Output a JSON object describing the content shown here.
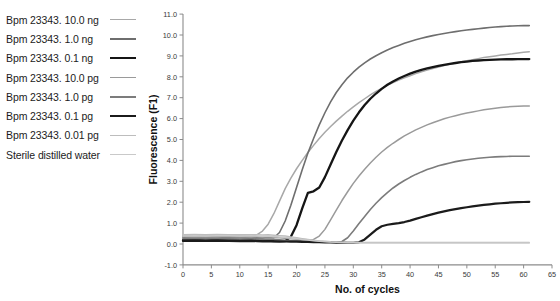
{
  "legend": {
    "position": "left",
    "items": [
      {
        "label": "Bpm 23343. 10.0 ng",
        "color": "#a8a8a8",
        "width": 1.5
      },
      {
        "label": "Bpm 23343. 1.0 ng",
        "color": "#6e6e6e",
        "width": 1.6
      },
      {
        "label": "Bpm 23343. 0.1 ng",
        "color": "#151515",
        "width": 2.3
      },
      {
        "label": "Bpm 23343. 10.0 pg",
        "color": "#9a9a9a",
        "width": 1.5
      },
      {
        "label": "Bpm 23343. 1.0 pg",
        "color": "#7c7c7c",
        "width": 1.6
      },
      {
        "label": "Bpm 23343. 0.1 pg",
        "color": "#1b1b1b",
        "width": 2.2
      },
      {
        "label": "Bpm 23343. 0.01 pg",
        "color": "#bdbdbd",
        "width": 1.4
      },
      {
        "label": "Sterile distilled water",
        "color": "#c9c9c9",
        "width": 1.5
      }
    ]
  },
  "chart_data": {
    "type": "line",
    "title": "",
    "xlabel": "No. of cycles",
    "ylabel": "Fluorescence (F1)",
    "xlim": [
      0,
      65
    ],
    "ylim": [
      -1.0,
      11.0
    ],
    "xticks": [
      0,
      5,
      10,
      15,
      20,
      25,
      30,
      35,
      40,
      45,
      50,
      55,
      60,
      65
    ],
    "xtick_labels": [
      "0",
      "5",
      "10",
      "15",
      "20",
      "25",
      "30",
      "35",
      "40",
      "45",
      "50",
      "55",
      "60",
      "65"
    ],
    "yticks": [
      -1.0,
      0.0,
      1.0,
      2.0,
      3.0,
      4.0,
      5.0,
      6.0,
      7.0,
      8.0,
      9.0,
      10.0,
      11.0
    ],
    "ytick_labels": [
      "-1.0",
      "0.0",
      "1.0",
      "2.0",
      "3.0",
      "4.0",
      "5.0",
      "6.0",
      "7.0",
      "8.0",
      "9.0",
      "10.0",
      "11.0"
    ],
    "grid": false,
    "x": [
      0,
      2,
      4,
      6,
      8,
      10,
      12,
      13,
      14,
      15,
      16,
      17,
      18,
      19,
      20,
      21,
      22,
      23,
      24,
      25,
      26,
      27,
      28,
      29,
      30,
      31,
      32,
      33,
      34,
      35,
      36,
      37,
      38,
      39,
      40,
      41,
      42,
      43,
      44,
      45,
      46,
      47,
      48,
      49,
      50,
      51,
      52,
      53,
      54,
      55,
      56,
      57,
      58,
      59,
      60,
      61
    ],
    "series": [
      {
        "name": "Bpm 23343. 10.0 ng",
        "color": "#a8a8a8",
        "width": 1.5,
        "plateau": 9.2,
        "takeoff_cycle": 13,
        "values": [
          0.4,
          0.42,
          0.4,
          0.43,
          0.41,
          0.42,
          0.4,
          0.44,
          0.62,
          0.95,
          1.45,
          2.05,
          2.65,
          3.15,
          3.6,
          4.0,
          4.38,
          4.72,
          5.05,
          5.35,
          5.62,
          5.88,
          6.12,
          6.35,
          6.56,
          6.76,
          6.95,
          7.13,
          7.3,
          7.45,
          7.59,
          7.72,
          7.84,
          7.95,
          8.05,
          8.15,
          8.24,
          8.32,
          8.4,
          8.47,
          8.54,
          8.6,
          8.66,
          8.72,
          8.77,
          8.82,
          8.87,
          8.92,
          8.96,
          9.0,
          9.04,
          9.07,
          9.1,
          9.14,
          9.17,
          9.2
        ]
      },
      {
        "name": "Bpm 23343. 1.0 ng",
        "color": "#6e6e6e",
        "width": 1.6,
        "plateau": 10.45,
        "takeoff_cycle": 16,
        "values": [
          0.3,
          0.28,
          0.3,
          0.29,
          0.31,
          0.3,
          0.28,
          0.3,
          0.29,
          0.31,
          0.3,
          0.55,
          1.1,
          1.85,
          2.7,
          3.55,
          4.35,
          5.05,
          5.7,
          6.28,
          6.8,
          7.25,
          7.62,
          7.95,
          8.22,
          8.46,
          8.67,
          8.85,
          9.01,
          9.15,
          9.28,
          9.4,
          9.5,
          9.6,
          9.69,
          9.77,
          9.84,
          9.91,
          9.97,
          10.02,
          10.07,
          10.12,
          10.16,
          10.2,
          10.24,
          10.27,
          10.3,
          10.33,
          10.36,
          10.38,
          10.4,
          10.42,
          10.43,
          10.44,
          10.45,
          10.45
        ]
      },
      {
        "name": "Bpm 23343. 0.1 ng",
        "color": "#151515",
        "width": 2.3,
        "plateau": 8.85,
        "takeoff_cycle": 18,
        "values": [
          0.18,
          0.2,
          0.18,
          0.19,
          0.17,
          0.19,
          0.18,
          0.17,
          0.18,
          0.16,
          0.14,
          0.13,
          0.14,
          0.35,
          0.9,
          1.7,
          2.45,
          2.52,
          2.7,
          3.2,
          3.8,
          4.4,
          4.95,
          5.45,
          5.9,
          6.3,
          6.65,
          6.95,
          7.2,
          7.42,
          7.62,
          7.78,
          7.92,
          8.04,
          8.15,
          8.25,
          8.33,
          8.4,
          8.46,
          8.52,
          8.57,
          8.62,
          8.66,
          8.7,
          8.73,
          8.76,
          8.78,
          8.8,
          8.81,
          8.82,
          8.83,
          8.84,
          8.84,
          8.85,
          8.85,
          8.85
        ]
      },
      {
        "name": "Bpm 23343. 10.0 pg",
        "color": "#9a9a9a",
        "width": 1.5,
        "plateau": 6.6,
        "takeoff_cycle": 22,
        "values": [
          0.35,
          0.36,
          0.34,
          0.36,
          0.35,
          0.34,
          0.36,
          0.35,
          0.33,
          0.34,
          0.32,
          0.3,
          0.28,
          0.26,
          0.24,
          0.22,
          0.2,
          0.22,
          0.38,
          0.7,
          1.15,
          1.62,
          2.08,
          2.5,
          2.9,
          3.25,
          3.58,
          3.88,
          4.15,
          4.4,
          4.62,
          4.82,
          5.0,
          5.17,
          5.32,
          5.46,
          5.58,
          5.7,
          5.8,
          5.9,
          5.99,
          6.07,
          6.14,
          6.21,
          6.27,
          6.32,
          6.37,
          6.42,
          6.46,
          6.5,
          6.53,
          6.56,
          6.58,
          6.59,
          6.6,
          6.6
        ]
      },
      {
        "name": "Bpm 23343. 1.0 pg",
        "color": "#7c7c7c",
        "width": 1.6,
        "plateau": 4.2,
        "takeoff_cycle": 26,
        "values": [
          0.25,
          0.26,
          0.24,
          0.26,
          0.25,
          0.24,
          0.25,
          0.24,
          0.22,
          0.23,
          0.22,
          0.2,
          0.18,
          0.17,
          0.16,
          0.15,
          0.14,
          0.13,
          0.12,
          0.11,
          0.1,
          0.1,
          0.12,
          0.3,
          0.62,
          0.98,
          1.32,
          1.65,
          1.95,
          2.22,
          2.46,
          2.68,
          2.87,
          3.04,
          3.19,
          3.33,
          3.45,
          3.56,
          3.65,
          3.74,
          3.81,
          3.88,
          3.94,
          3.99,
          4.03,
          4.07,
          4.1,
          4.13,
          4.15,
          4.17,
          4.18,
          4.19,
          4.2,
          4.2,
          4.2,
          4.2
        ]
      },
      {
        "name": "Bpm 23343. 0.1 pg",
        "color": "#1b1b1b",
        "width": 2.2,
        "plateau": 2.02,
        "takeoff_cycle": 30,
        "values": [
          0.15,
          0.16,
          0.15,
          0.16,
          0.15,
          0.14,
          0.15,
          0.14,
          0.13,
          0.14,
          0.13,
          0.12,
          0.12,
          0.11,
          0.11,
          0.1,
          0.1,
          0.09,
          0.09,
          0.08,
          0.08,
          0.07,
          0.07,
          0.06,
          0.06,
          0.08,
          0.22,
          0.45,
          0.68,
          0.85,
          0.92,
          0.96,
          1.0,
          1.05,
          1.12,
          1.2,
          1.28,
          1.36,
          1.43,
          1.5,
          1.56,
          1.62,
          1.67,
          1.72,
          1.76,
          1.8,
          1.84,
          1.87,
          1.9,
          1.93,
          1.95,
          1.97,
          1.99,
          2.0,
          2.01,
          2.02
        ]
      },
      {
        "name": "Bpm 23343. 0.01 pg",
        "color": "#bdbdbd",
        "width": 1.4,
        "plateau": 0.08,
        "takeoff_cycle": null,
        "values": [
          0.45,
          0.46,
          0.44,
          0.46,
          0.45,
          0.44,
          0.45,
          0.44,
          0.43,
          0.44,
          0.42,
          0.4,
          0.38,
          0.34,
          0.3,
          0.26,
          0.22,
          0.18,
          0.15,
          0.13,
          0.11,
          0.1,
          0.09,
          0.09,
          0.08,
          0.08,
          0.08,
          0.08,
          0.08,
          0.08,
          0.08,
          0.08,
          0.08,
          0.08,
          0.08,
          0.08,
          0.08,
          0.08,
          0.08,
          0.08,
          0.08,
          0.08,
          0.08,
          0.08,
          0.08,
          0.08,
          0.08,
          0.08,
          0.08,
          0.08,
          0.08,
          0.08,
          0.08,
          0.08,
          0.08,
          0.08
        ]
      },
      {
        "name": "Sterile distilled water",
        "color": "#c9c9c9",
        "width": 1.5,
        "plateau": 0.05,
        "takeoff_cycle": null,
        "values": [
          0.38,
          0.4,
          0.38,
          0.4,
          0.39,
          0.38,
          0.39,
          0.38,
          0.37,
          0.38,
          0.36,
          0.34,
          0.32,
          0.29,
          0.26,
          0.22,
          0.19,
          0.16,
          0.13,
          0.11,
          0.09,
          0.08,
          0.07,
          0.06,
          0.06,
          0.05,
          0.05,
          0.05,
          0.05,
          0.05,
          0.05,
          0.05,
          0.05,
          0.05,
          0.05,
          0.05,
          0.05,
          0.05,
          0.05,
          0.05,
          0.05,
          0.05,
          0.05,
          0.05,
          0.05,
          0.05,
          0.05,
          0.05,
          0.05,
          0.05,
          0.05,
          0.05,
          0.05,
          0.05,
          0.05,
          0.05
        ]
      }
    ]
  }
}
